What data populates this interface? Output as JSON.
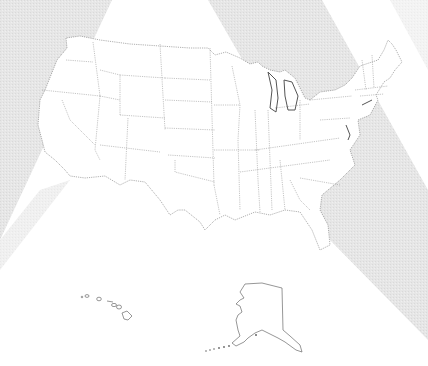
{
  "map": {
    "title": "",
    "type": "blank-outline",
    "region": "United States",
    "insets": [
      "Hawaii",
      "Alaska"
    ],
    "colors": {
      "background": "#ffffff",
      "texture": "#e4e4e4",
      "state_fill": "#ffffff",
      "border": "#7a7a7a",
      "coast": "#555555"
    }
  }
}
